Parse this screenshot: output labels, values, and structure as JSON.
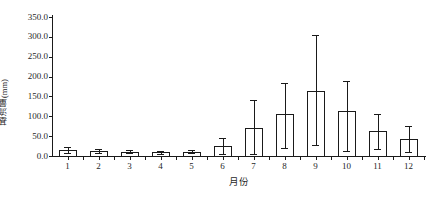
{
  "chart_data": {
    "type": "bar",
    "title": "",
    "xlabel": "月份",
    "ylabel": "基流量(mm)",
    "categories": [
      "1",
      "2",
      "3",
      "4",
      "5",
      "6",
      "7",
      "8",
      "9",
      "10",
      "11",
      "12"
    ],
    "values": [
      14,
      12,
      10,
      9,
      10,
      25,
      70,
      107,
      163,
      113,
      62,
      43
    ],
    "error_low": [
      8,
      8,
      7,
      6,
      7,
      5,
      5,
      20,
      27,
      12,
      18,
      10
    ],
    "error_high": [
      22,
      18,
      14,
      13,
      14,
      45,
      140,
      185,
      305,
      190,
      105,
      75
    ],
    "ylim": [
      0.0,
      350.0
    ],
    "ytick_labels": [
      "0.0",
      "50.0",
      "100.0",
      "150.0",
      "200.0",
      "250.0",
      "300.0",
      "350.0"
    ],
    "ytick_values": [
      0,
      50,
      100,
      150,
      200,
      250,
      300,
      350
    ],
    "grid": false,
    "legend": null,
    "legend_position": "none",
    "bar_fill_color": "#ffffff",
    "bar_edge_color": "#1a1a1a",
    "error_bar_color": "#1a1a1a",
    "axis_color": "#1a1a1a",
    "background_color": "#ffffff"
  }
}
